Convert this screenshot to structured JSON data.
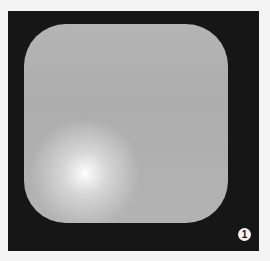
{
  "figure": {
    "panel_color": "#161616",
    "shape": {
      "type": "rounded-square",
      "fill_color": "#b0b0b0",
      "highlight": "white radial glow, lower-left"
    },
    "badge": {
      "label": "1"
    }
  }
}
